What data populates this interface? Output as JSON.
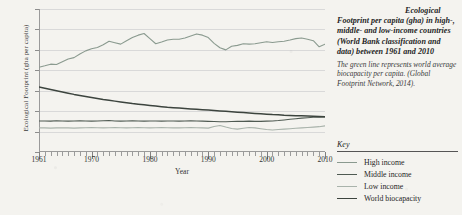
{
  "caption": {
    "heading": "Ecological Footprint per capita (gha) in high-, middle- and low-income countries (World Bank classification and data) between 1961 and 2010",
    "subtext": "The green line represents world average biocapacity per capita. (Global Footprint Network, 2014)."
  },
  "key": {
    "title": "Key",
    "items": [
      {
        "label": "High income",
        "color": "#8a9a8f"
      },
      {
        "label": "Middle income",
        "color": "#4f5a52"
      },
      {
        "label": "Low income",
        "color": "#a9b3ab"
      },
      {
        "label": "World biocapacity",
        "color": "#3c443e"
      }
    ]
  },
  "chart_data": {
    "type": "line",
    "title": "Ecological Footprint per capita (gha) in high-, middle- and low-income countries",
    "xlabel": "Year",
    "ylabel": "Ecological Footprint (gha per capita)",
    "xlim": [
      1961,
      2010
    ],
    "ylim": [
      0,
      7
    ],
    "yticks": [
      0,
      1,
      2,
      3,
      4,
      5,
      6,
      7
    ],
    "xticks": [
      1961,
      1970,
      1980,
      1990,
      2000,
      2010
    ],
    "grid": true,
    "legend_position": "right",
    "x": [
      1961,
      1962,
      1963,
      1964,
      1965,
      1966,
      1967,
      1968,
      1969,
      1970,
      1971,
      1972,
      1973,
      1974,
      1975,
      1976,
      1977,
      1978,
      1979,
      1980,
      1981,
      1982,
      1983,
      1984,
      1985,
      1986,
      1987,
      1988,
      1989,
      1990,
      1991,
      1992,
      1993,
      1994,
      1995,
      1996,
      1997,
      1998,
      1999,
      2000,
      2001,
      2002,
      2003,
      2004,
      2005,
      2006,
      2007,
      2008,
      2009,
      2010
    ],
    "series": [
      {
        "name": "High income",
        "color": "#8a9a8f",
        "values": [
          4.15,
          4.22,
          4.3,
          4.28,
          4.42,
          4.55,
          4.62,
          4.8,
          4.95,
          5.05,
          5.12,
          5.25,
          5.42,
          5.35,
          5.28,
          5.45,
          5.6,
          5.72,
          5.8,
          5.55,
          5.3,
          5.38,
          5.48,
          5.52,
          5.52,
          5.58,
          5.68,
          5.78,
          5.72,
          5.6,
          5.32,
          5.1,
          5.0,
          5.18,
          5.22,
          5.3,
          5.28,
          5.3,
          5.35,
          5.4,
          5.36,
          5.4,
          5.42,
          5.48,
          5.55,
          5.58,
          5.52,
          5.45,
          5.15,
          5.28
        ]
      },
      {
        "name": "Middle income",
        "color": "#4f5a52",
        "values": [
          1.52,
          1.52,
          1.51,
          1.53,
          1.52,
          1.51,
          1.52,
          1.53,
          1.52,
          1.51,
          1.52,
          1.53,
          1.54,
          1.52,
          1.51,
          1.52,
          1.53,
          1.52,
          1.51,
          1.52,
          1.52,
          1.51,
          1.52,
          1.52,
          1.51,
          1.52,
          1.53,
          1.52,
          1.51,
          1.5,
          1.49,
          1.48,
          1.48,
          1.49,
          1.5,
          1.5,
          1.51,
          1.5,
          1.5,
          1.51,
          1.52,
          1.54,
          1.57,
          1.6,
          1.63,
          1.66,
          1.68,
          1.7,
          1.7,
          1.72
        ]
      },
      {
        "name": "Low income",
        "color": "#a9b3ab",
        "values": [
          1.18,
          1.18,
          1.17,
          1.18,
          1.19,
          1.18,
          1.17,
          1.18,
          1.19,
          1.2,
          1.19,
          1.18,
          1.19,
          1.2,
          1.19,
          1.18,
          1.19,
          1.2,
          1.19,
          1.18,
          1.19,
          1.2,
          1.19,
          1.18,
          1.18,
          1.19,
          1.2,
          1.19,
          1.18,
          1.17,
          1.25,
          1.3,
          1.22,
          1.15,
          1.12,
          1.16,
          1.2,
          1.18,
          1.14,
          1.1,
          1.08,
          1.1,
          1.12,
          1.14,
          1.16,
          1.18,
          1.2,
          1.22,
          1.24,
          1.28
        ]
      },
      {
        "name": "World biocapacity",
        "color": "#3c443e",
        "values": [
          3.18,
          3.12,
          3.06,
          3.0,
          2.94,
          2.88,
          2.82,
          2.77,
          2.72,
          2.67,
          2.62,
          2.57,
          2.53,
          2.49,
          2.45,
          2.41,
          2.37,
          2.34,
          2.31,
          2.28,
          2.25,
          2.22,
          2.19,
          2.17,
          2.15,
          2.13,
          2.11,
          2.09,
          2.07,
          2.05,
          2.03,
          2.01,
          1.99,
          1.97,
          1.95,
          1.93,
          1.91,
          1.89,
          1.87,
          1.85,
          1.83,
          1.82,
          1.8,
          1.79,
          1.78,
          1.77,
          1.76,
          1.75,
          1.74,
          1.73
        ]
      }
    ]
  }
}
